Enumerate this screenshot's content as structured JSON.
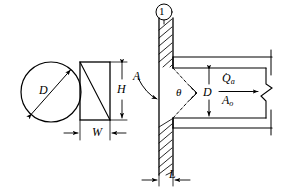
{
  "figure": {
    "background_color": "#ffffff",
    "line_color": "#000000",
    "stroke_width": 1.1
  },
  "labels": {
    "circle_diameter": "D",
    "rect_height": "H",
    "rect_width": "W",
    "section_marker": "A",
    "cone_angle": "θ",
    "duct_diameter": "D",
    "flow_rate": "Q",
    "flow_rate_dot": "·",
    "flow_rate_sub": "a",
    "area": "A",
    "area_sub": "o",
    "wall_thickness": "L",
    "station_number": "1"
  },
  "views": {
    "circular_section": {
      "name": "circular-cross-section",
      "shape": "circle",
      "center_x": 51,
      "center_y": 92,
      "radius": 30,
      "dimension": "D"
    },
    "rectangular_section": {
      "name": "rectangular-cross-section",
      "shape": "rectangle",
      "x": 80,
      "y": 62,
      "width": 30,
      "height": 58,
      "diagonal": true,
      "dimensions": [
        "H",
        "W"
      ]
    },
    "duct_section": {
      "name": "duct-through-wall",
      "wall_x": 159,
      "wall_thickness_px": 14,
      "duct_top_y": 68,
      "duct_bottom_y": 118,
      "outer_top_y": 57,
      "outer_bottom_y": 128,
      "break_x": 265,
      "dimensions": [
        "L",
        "D",
        "θ"
      ]
    }
  },
  "annotations": {
    "flow_arrow": "flow-direction-right",
    "break_symbol": "break-line-zigzag",
    "hatching": "wall-section-hatch",
    "leader": "curved-leader-arrow"
  }
}
